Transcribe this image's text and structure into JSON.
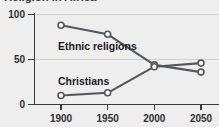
{
  "chart_data": {
    "type": "line",
    "title": "Religion in Africa",
    "xlabel": "",
    "ylabel": "",
    "x": [
      1900,
      1950,
      2000,
      2050
    ],
    "xtick_labels": [
      "1900",
      "1950",
      "2000",
      "2050"
    ],
    "ytick_labels": [
      "0",
      "50",
      "100"
    ],
    "yticks": [
      0,
      50,
      100
    ],
    "ylim": [
      0,
      100
    ],
    "xlim": [
      1880,
      2065
    ],
    "grid": "horizontal",
    "legend": "inline-labels",
    "series": [
      {
        "name": "Ethnic religions",
        "label": "Ethnic religions",
        "values": [
          88,
          78,
          44,
          36
        ],
        "color": "#53565a"
      },
      {
        "name": "Christians",
        "label": "Christians",
        "values": [
          10,
          13,
          42,
          46
        ],
        "color": "#53565a"
      }
    ]
  },
  "axis": {
    "y_label_0": "0",
    "y_label_50": "50",
    "y_label_100": "100",
    "x_label_1900": "1900",
    "x_label_1950": "1950",
    "x_label_2000": "2000",
    "x_label_2050": "2050"
  },
  "labels": {
    "ethnic": "Ethnic religions",
    "christians": "Christians"
  },
  "colors": {
    "background": "#eeeeee",
    "line": "#53565a",
    "axis": "#3d3d3d",
    "grid": "#d2d2d2",
    "text": "#1a1a1a"
  }
}
